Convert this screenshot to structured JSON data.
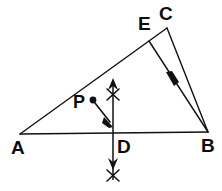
{
  "figure": {
    "background_color": "#ffffff",
    "stroke_color": "#111111",
    "width": 222,
    "height": 191
  },
  "labels": {
    "a": "A",
    "b": "B",
    "c": "C",
    "d": "D",
    "e": "E",
    "p": "P"
  },
  "points": {
    "A": {
      "x": 20,
      "y": 134
    },
    "B": {
      "x": 208,
      "y": 132
    },
    "C": {
      "x": 167,
      "y": 28
    },
    "D": {
      "x": 113,
      "y": 133
    },
    "E": {
      "x": 149,
      "y": 41
    },
    "P": {
      "x": 93,
      "y": 100
    }
  },
  "segments": [
    {
      "name": "segment-AB",
      "from": "A",
      "to": "B"
    },
    {
      "name": "segment-AC",
      "from": "A",
      "to": "C"
    },
    {
      "name": "segment-CB",
      "from": "C",
      "to": "B"
    },
    {
      "name": "segment-EB",
      "from": "E",
      "to": "B",
      "arrow": "midpoint"
    }
  ],
  "construction_line": {
    "name": "perpendicular-bisector-through-D",
    "x": 113,
    "y_top": 80,
    "y_bottom": 182,
    "arrow_top": true,
    "arrow_bottom": true,
    "tick_marks": [
      {
        "name": "tick-upper",
        "y": 95
      },
      {
        "name": "tick-lower",
        "y": 176
      }
    ]
  },
  "pointer": {
    "name": "pointer-from-P",
    "from": {
      "x": 96,
      "y": 103
    },
    "to": {
      "x": 111,
      "y": 124
    }
  }
}
